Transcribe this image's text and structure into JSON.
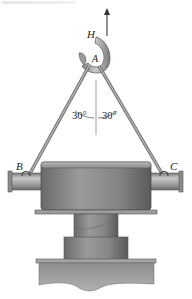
{
  "figure": {
    "labels": {
      "hook": "H",
      "ring": "A",
      "left_attachment": "B",
      "right_attachment": "C"
    },
    "angles": {
      "left": "30°",
      "right": "30°"
    },
    "colors": {
      "metal_dark": "#5e5e5e",
      "metal_mid": "#8a8a8a",
      "metal_light": "#c4c4c4",
      "cable": "#9a9a9a",
      "text": "#222222"
    }
  }
}
